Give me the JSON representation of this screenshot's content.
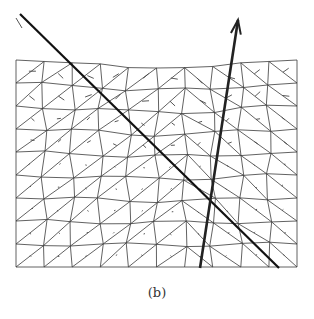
{
  "figure": {
    "caption": "(b)",
    "mesh": {
      "type": "triangular-mesh",
      "x_min": 16,
      "x_max": 297,
      "y_top": 60,
      "y_bottom": 267,
      "cols": 10,
      "rows": 9,
      "line_color": "#333333"
    },
    "rays": [
      {
        "name": "incident-ray",
        "from": [
          20,
          14
        ],
        "to": [
          279,
          268
        ],
        "width": 2.2,
        "color": "#111111"
      },
      {
        "name": "refracted-ray",
        "from": [
          200,
          268
        ],
        "to": [
          238,
          20
        ],
        "width": 2.6,
        "color": "#222222",
        "arrow": true
      }
    ],
    "intersection": [
      205,
      190
    ]
  }
}
